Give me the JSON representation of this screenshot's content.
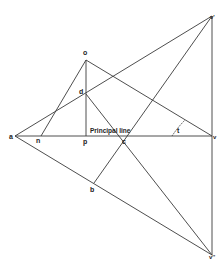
{
  "diagram": {
    "type": "perspective-construction",
    "line_color": "#3a3a3a",
    "label_color": "#222222",
    "principal_line_label": "Principal line",
    "points": {
      "a": {
        "label": "a",
        "x": 15,
        "y": 136
      },
      "n": {
        "label": "n",
        "x": 41,
        "y": 136
      },
      "p": {
        "label": "p",
        "x": 86,
        "y": 136
      },
      "o": {
        "label": "o",
        "x": 86,
        "y": 60
      },
      "d": {
        "label": "d",
        "x": 86,
        "y": 94
      },
      "c": {
        "label": "c",
        "x": 121,
        "y": 136
      },
      "b": {
        "label": "b",
        "x": 94,
        "y": 183
      },
      "v": {
        "label": "v",
        "x": 212,
        "y": 136
      },
      "v_top": {
        "label": "v'",
        "x": 212,
        "y": 16
      },
      "v_bottom": {
        "label": "v''",
        "x": 212,
        "y": 255
      }
    },
    "angle_label": "t"
  }
}
